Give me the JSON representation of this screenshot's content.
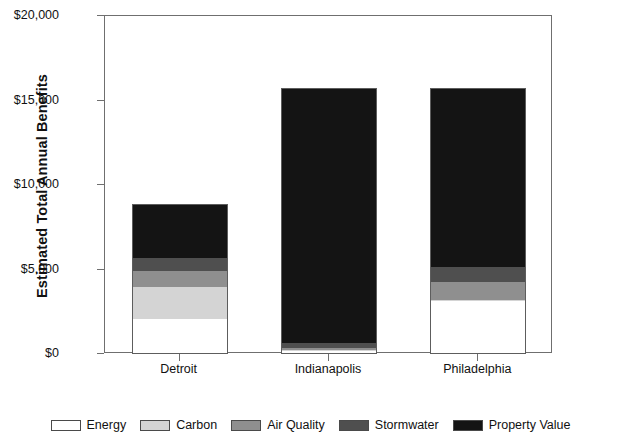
{
  "chart_data": {
    "type": "bar",
    "stacked": true,
    "title": "",
    "xlabel": "",
    "ylabel": "Estimated Total Annual Benefits",
    "categories": [
      "Detroit",
      "Indianapolis",
      "Philadelphia"
    ],
    "ylim": [
      0,
      20000
    ],
    "ytick_values": [
      0,
      5000,
      10000,
      15000,
      20000
    ],
    "ytick_labels": [
      "$0",
      "$5,000",
      "$10,000",
      "$15,000",
      "$20,000"
    ],
    "grid": false,
    "legend_position": "bottom",
    "series": [
      {
        "name": "Energy",
        "color": "#ffffff",
        "values": [
          2000,
          100,
          3050
        ]
      },
      {
        "name": "Carbon",
        "color": "#d4d4d4",
        "values": [
          1900,
          100,
          80
        ]
      },
      {
        "name": "Air Quality",
        "color": "#8f8f8f",
        "values": [
          950,
          100,
          1050
        ]
      },
      {
        "name": "Stormwater",
        "color": "#4f4f4f",
        "values": [
          770,
          300,
          900
        ]
      },
      {
        "name": "Property Value",
        "color": "#141414",
        "values": [
          3130,
          15050,
          10570
        ]
      }
    ],
    "totals": [
      8750,
      15650,
      15650
    ]
  },
  "legend": {
    "items": [
      {
        "label": "Energy",
        "color": "#ffffff"
      },
      {
        "label": "Carbon",
        "color": "#d4d4d4"
      },
      {
        "label": "Air Quality",
        "color": "#8f8f8f"
      },
      {
        "label": "Stormwater",
        "color": "#4f4f4f"
      },
      {
        "label": "Property Value",
        "color": "#141414"
      }
    ]
  }
}
